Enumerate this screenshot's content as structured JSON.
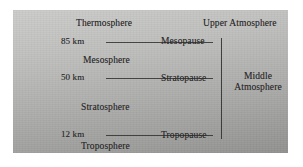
{
  "figure": {
    "type": "atmospheric-layers-diagram",
    "background_color": "#ffffff",
    "panel_color": "#bcbcba",
    "line_color": "#3a3a3a",
    "text_color": "#2b2b2b"
  },
  "altitudes": [
    {
      "id": "alt-85",
      "label": "85 km"
    },
    {
      "id": "alt-50",
      "label": "50 km"
    },
    {
      "id": "alt-12",
      "label": "12 km"
    }
  ],
  "layers": [
    {
      "id": "thermosphere",
      "label": "Thermosphere"
    },
    {
      "id": "mesosphere",
      "label": "Mesosphere"
    },
    {
      "id": "stratosphere",
      "label": "Stratosphere"
    },
    {
      "id": "troposphere",
      "label": "Troposphere"
    }
  ],
  "boundaries": [
    {
      "id": "mesopause",
      "label": "Mesopause",
      "altitude": "85 km"
    },
    {
      "id": "stratopause",
      "label": "Stratopause",
      "altitude": "50 km"
    },
    {
      "id": "tropopause",
      "label": "Tropopause",
      "altitude": "12 km"
    }
  ],
  "regions": [
    {
      "id": "upper-atmosphere",
      "label": "Upper Atmosphere"
    },
    {
      "id": "middle-atmosphere",
      "label_line1": "Middle",
      "label_line2": "Atmosphere"
    }
  ]
}
